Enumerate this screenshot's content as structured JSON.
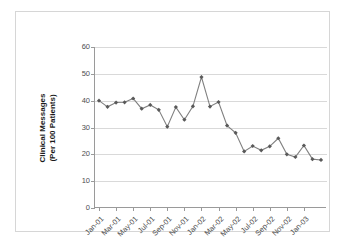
{
  "chart_data": {
    "type": "line",
    "title": "",
    "xlabel": "",
    "ylabel": "Clinical Messages\n(Per 100 Patients)",
    "ylabel_line1": "Clinical Messages",
    "ylabel_line2": "(Per 100 Patients)",
    "ylim": [
      0,
      60
    ],
    "yticks": [
      0,
      10,
      20,
      30,
      40,
      50,
      60
    ],
    "ytick_labels": [
      "0",
      "10",
      "20",
      "30",
      "40",
      "50",
      "60"
    ],
    "grid": true,
    "legend": "none",
    "marker": "diamond",
    "series_color": "#595959",
    "line_color": "#808080",
    "x": [
      "Jan-01",
      "Feb-01",
      "Mar-01",
      "Apr-01",
      "May-01",
      "Jun-01",
      "Jul-01",
      "Aug-01",
      "Sep-01",
      "Oct-01",
      "Nov-01",
      "Dec-01",
      "Jan-02",
      "Feb-02",
      "Mar-02",
      "Apr-02",
      "May-02",
      "Jun-02",
      "Jul-02",
      "Aug-02",
      "Sep-02",
      "Oct-02",
      "Nov-02",
      "Dec-02",
      "Jan-03",
      "Feb-03",
      "Mar-03"
    ],
    "values": [
      40.0,
      37.7,
      39.3,
      39.4,
      40.8,
      37.0,
      38.4,
      36.6,
      30.3,
      37.6,
      32.9,
      37.9,
      48.8,
      37.8,
      39.5,
      30.7,
      28.0,
      21.1,
      23.1,
      21.5,
      23.0,
      26.0,
      20.0,
      19.0,
      23.3,
      18.2,
      17.9
    ],
    "xtick_labels": [
      "Jan-01",
      "Mar-01",
      "May-01",
      "Jul-01",
      "Sep-01",
      "Nov-01",
      "Jan-02",
      "Mar-02",
      "May-02",
      "Jul-02",
      "Sep-02",
      "Nov-02",
      "Jan-03"
    ],
    "xtick_indices": [
      0,
      2,
      4,
      6,
      8,
      10,
      12,
      14,
      16,
      18,
      20,
      22,
      24
    ]
  }
}
